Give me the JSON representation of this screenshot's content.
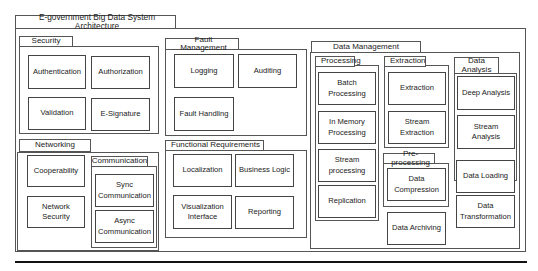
{
  "diagram": {
    "title": "E-government Big Data System Architecture",
    "groups": {
      "security": {
        "label": "Security",
        "items": [
          "Authentication",
          "Authorization",
          "Validation",
          "E-Signature"
        ]
      },
      "fault_management": {
        "label": "Fault Management",
        "items": [
          "Logging",
          "Auditing",
          "Fault Handling"
        ]
      },
      "networking": {
        "label": "Networking",
        "items": [
          "Cooperability",
          "Network\nSecurity"
        ],
        "communication": {
          "label": "Communication",
          "items": [
            "Sync\nCommunication",
            "Async\nCommunication"
          ]
        }
      },
      "functional_requirements": {
        "label": "Functional Requirements",
        "items": [
          "Localization",
          "Business Logic",
          "Visualization\nInterface",
          "Reporting"
        ]
      },
      "data_management": {
        "label": "Data Management",
        "processing": {
          "label": "Processing",
          "items": [
            "Batch\nProcessing",
            "In Memory\nProcessing",
            "Stream\nprocessing",
            "Replication"
          ]
        },
        "extraction": {
          "label": "Extraction",
          "items": [
            "Extraction",
            "Stream\nExtraction"
          ]
        },
        "pre_processing": {
          "label": "Pre-processing",
          "items": [
            "Data\nCompression"
          ]
        },
        "data_analysis": {
          "label": "Data\nAnalysis",
          "items": [
            "Deep Analysis",
            "Stream Analysis"
          ]
        },
        "standalone": [
          "Data Archiving",
          "Data Loading",
          "Data\nTransformation"
        ]
      }
    }
  }
}
